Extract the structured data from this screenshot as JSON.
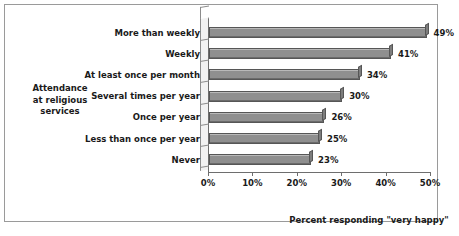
{
  "chart_data": {
    "type": "bar",
    "orientation": "horizontal",
    "title": "",
    "xlabel": "Percent responding \"very happy\"",
    "ylabel": "Attendance at religious services",
    "ylabel_lines": [
      "Attendance",
      "at religious",
      "services"
    ],
    "categories": [
      "More than weekly",
      "Weekly",
      "At least once per month",
      "Several times per year",
      "Once per year",
      "Less than once per year",
      "Never"
    ],
    "values": [
      49,
      41,
      34,
      30,
      26,
      25,
      23
    ],
    "value_labels": [
      "49%",
      "41%",
      "34%",
      "30%",
      "26%",
      "25%",
      "23%"
    ],
    "xlim": [
      0,
      50
    ],
    "xticks": [
      0,
      10,
      20,
      30,
      40,
      50
    ],
    "xtick_labels": [
      "0%",
      "10%",
      "20%",
      "30%",
      "40%",
      "50%"
    ],
    "grid": false,
    "legend": false,
    "bar_color": "#8f8f8f",
    "bar_edge_color": "#565656",
    "text_color": "#1a1a1a",
    "frame_color": "#9a9a9a",
    "background": "#ffffff"
  }
}
